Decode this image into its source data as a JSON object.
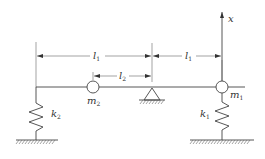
{
  "diagram": {
    "title": "",
    "labels": {
      "axis_x": "x",
      "l1_left": {
        "main": "l",
        "sub": "1"
      },
      "l2": {
        "main": "l",
        "sub": "2"
      },
      "l1_right": {
        "main": "l",
        "sub": "1"
      },
      "m1": {
        "main": "m",
        "sub": "1"
      },
      "m2": {
        "main": "m",
        "sub": "2"
      },
      "k1": {
        "main": "k",
        "sub": "1"
      },
      "k2": {
        "main": "k",
        "sub": "2"
      }
    },
    "colors": {
      "line": "#444444",
      "background": "#ffffff"
    }
  }
}
